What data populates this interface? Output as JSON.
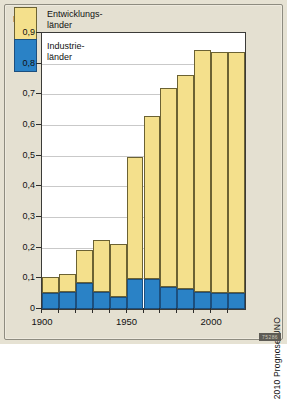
{
  "figure": {
    "background_color": "#e4e0d1",
    "plot_background": "#ffffff",
    "corner_code": "75286"
  },
  "legend": {
    "developing_label": "Entwicklungs-\nländer",
    "industrial_label": "Industrie-\nländer",
    "developing_color": "#f4e08c",
    "industrial_color": "#2a82c6"
  },
  "source_note": "2010 Prognose UNO",
  "chart_data": {
    "type": "bar",
    "stacked": true,
    "title": "",
    "subtitle": "",
    "xlabel": "",
    "ylabel": "Mrd.",
    "ylim": [
      0,
      0.9
    ],
    "grid": true,
    "legend_position": "top-left",
    "categories": [
      "1900",
      "1910",
      "1920",
      "1930",
      "1940",
      "1950",
      "1960",
      "1970",
      "1980",
      "1990",
      "2000",
      "2010"
    ],
    "xtick_labels": [
      "1900",
      "1950",
      "2000"
    ],
    "ytick_labels": [
      "0",
      "0,1",
      "0,2",
      "0,3",
      "0,4",
      "0,5",
      "0,6",
      "0,7",
      "0,8",
      "0,9"
    ],
    "ytick_values": [
      0,
      0.1,
      0.2,
      0.3,
      0.4,
      0.5,
      0.6,
      0.7,
      0.8,
      0.9
    ],
    "series": [
      {
        "name": "Industrieländer",
        "color": "#2a82c6",
        "values": [
          0.051,
          0.057,
          0.085,
          0.057,
          0.039,
          0.098,
          0.098,
          0.073,
          0.066,
          0.056,
          0.052,
          0.052
        ]
      },
      {
        "name": "Entwicklungsländer",
        "color": "#f4e08c",
        "values": [
          0.054,
          0.058,
          0.109,
          0.167,
          0.174,
          0.397,
          0.531,
          0.647,
          0.697,
          0.789,
          0.786,
          0.786
        ]
      }
    ],
    "totals": [
      0.105,
      0.115,
      0.194,
      0.224,
      0.213,
      0.495,
      0.629,
      0.72,
      0.763,
      0.845,
      0.838,
      0.838
    ]
  }
}
